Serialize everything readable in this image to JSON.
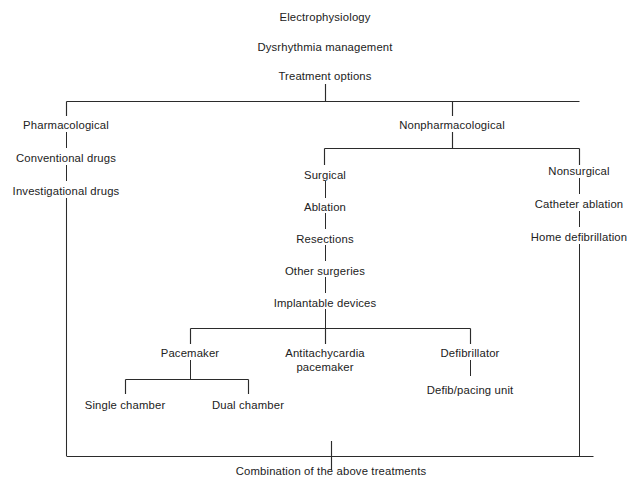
{
  "diagram": {
    "line_color": "#2b2b2b",
    "text_color": "#222222",
    "background": "#ffffff",
    "nodes": {
      "electrophysiology": "Electrophysiology",
      "dysrhythmia_management": "Dysrhythmia management",
      "treatment_options": "Treatment options",
      "pharmacological": "Pharmacological",
      "conventional_drugs": "Conventional drugs",
      "investigational_drugs": "Investigational drugs",
      "nonpharmacological": "Nonpharmacological",
      "surgical": "Surgical",
      "ablation": "Ablation",
      "resections": "Resections",
      "other_surgeries": "Other surgeries",
      "implantable_devices": "Implantable devices",
      "nonsurgical": "Nonsurgical",
      "catheter_ablation": "Catheter ablation",
      "home_defibrillation": "Home defibrillation",
      "pacemaker": "Pacemaker",
      "antitachycardia_pacemaker_line1": "Antitachycardia",
      "antitachycardia_pacemaker_line2": "pacemaker",
      "defibrillator": "Defibrillator",
      "defib_pacing_unit": "Defib/pacing unit",
      "single_chamber": "Single chamber",
      "dual_chamber": "Dual chamber",
      "combination": "Combination of the above treatments"
    }
  }
}
